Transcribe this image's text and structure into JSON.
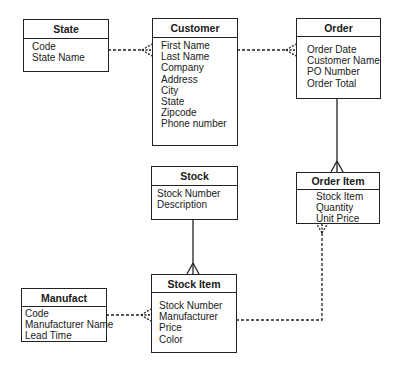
{
  "entities": {
    "state": {
      "title": "State",
      "fields": [
        "Code",
        "State Name"
      ]
    },
    "customer": {
      "title": "Customer",
      "fields": [
        "First Name",
        "Last Name",
        "Company",
        "Address",
        "City",
        "State",
        "Zipcode",
        "Phone number"
      ]
    },
    "order": {
      "title": "Order",
      "fields": [
        "Order Date",
        "Customer Name",
        "PO Number",
        "Order Total"
      ]
    },
    "stock": {
      "title": "Stock",
      "fields": [
        "Stock Number",
        "Description"
      ]
    },
    "order_item": {
      "title": "Order Item",
      "fields": [
        "Stock Item",
        "Quantity",
        "Unit Price"
      ]
    },
    "manufact": {
      "title": "Manufact",
      "fields": [
        "Code",
        "Manufacturer Name",
        "Lead Time"
      ]
    },
    "stock_item": {
      "title": "Stock Item",
      "fields": [
        "Stock Number",
        "Manufacturer",
        "Price",
        "Color"
      ]
    }
  },
  "relationships": [
    {
      "from": "State",
      "to": "Customer",
      "style": "dashed",
      "cardinality": "one-to-many-optional"
    },
    {
      "from": "Customer",
      "to": "Order",
      "style": "dashed",
      "cardinality": "one-to-many-optional"
    },
    {
      "from": "Order",
      "to": "Order Item",
      "style": "solid",
      "cardinality": "one-to-many"
    },
    {
      "from": "Stock",
      "to": "Stock Item",
      "style": "solid",
      "cardinality": "one-to-many"
    },
    {
      "from": "Manufact",
      "to": "Stock Item",
      "style": "dashed",
      "cardinality": "one-to-many-optional"
    },
    {
      "from": "Stock Item",
      "to": "Order Item",
      "style": "dashed",
      "cardinality": "one-to-many-optional"
    }
  ]
}
